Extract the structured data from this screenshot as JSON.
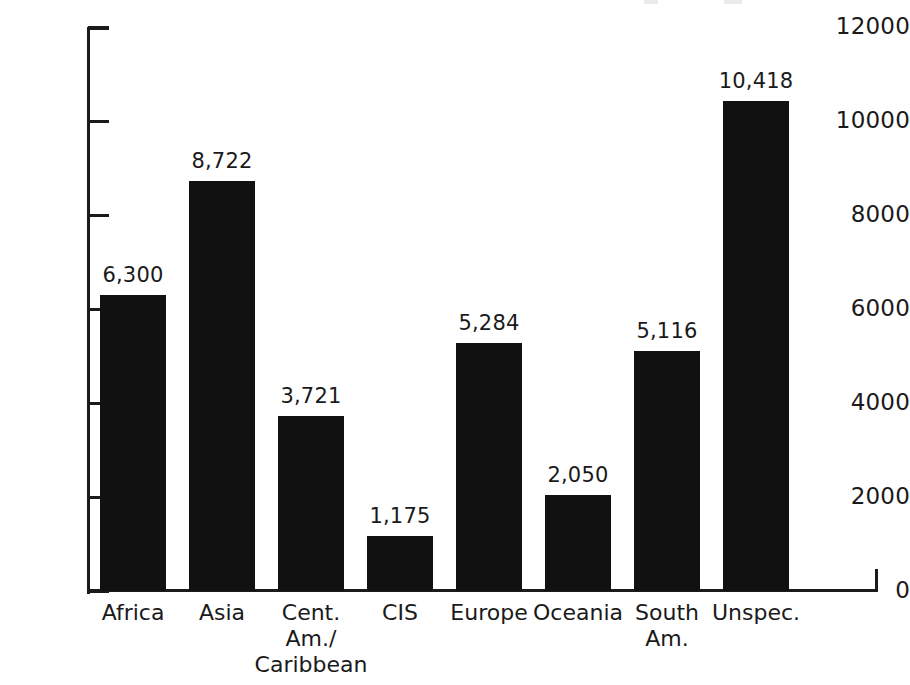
{
  "chart_data": {
    "type": "bar",
    "title": "",
    "xlabel": "",
    "ylabel": "",
    "categories": [
      "Africa",
      "Asia",
      "Cent.\nAm./\nCaribbean",
      "CIS",
      "Europe",
      "Oceania",
      "South\nAm.",
      "Unspec."
    ],
    "values": [
      6300,
      8722,
      3721,
      1175,
      5284,
      2050,
      5116,
      10418
    ],
    "value_labels": [
      "6,300",
      "8,722",
      "3,721",
      "1,175",
      "5,284",
      "2,050",
      "5,116",
      "10,418"
    ],
    "ylim": [
      0,
      12000
    ],
    "ytick_labels": [
      "12000",
      "10000",
      "8000",
      "6000",
      "4000",
      "2000",
      "0"
    ],
    "yticks": [
      12000,
      10000,
      8000,
      6000,
      4000,
      2000,
      0
    ],
    "grid": false,
    "legend": false,
    "bar_color": "#111111",
    "axis_color": "#1b1b1b",
    "text_color": "#1a1a1a",
    "background": "#ffffff"
  }
}
